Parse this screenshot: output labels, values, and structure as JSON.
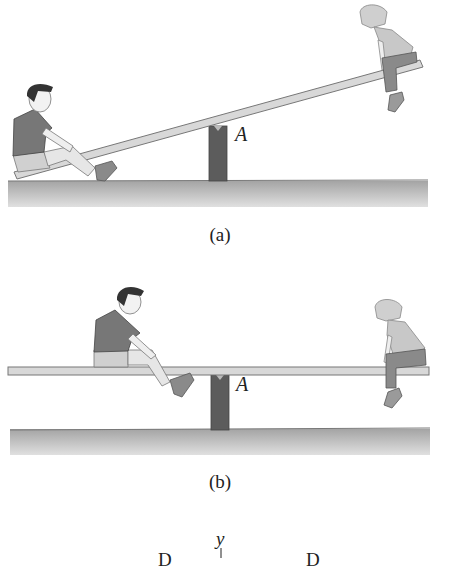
{
  "figure_a": {
    "caption": "(a)",
    "pivot_label": "A",
    "description": "Seesaw tilted: boy sitting on low left end touching ground, girl on raised right end"
  },
  "figure_b": {
    "caption": "(b)",
    "pivot_label": "A",
    "description": "Seesaw balanced horizontally: boy sitting nearer pivot on left, girl at far right end"
  },
  "figure_c": {
    "axis_label": "y",
    "left_label": "D",
    "right_label": "D"
  },
  "colors": {
    "post": "#5c5c5c",
    "ground_top": "#a8a8a8",
    "ground_bottom": "#dcdcdc",
    "plank": "#d8d8d8",
    "plank_stroke": "#7a7a7a",
    "boy_shirt": "#777777",
    "girl_shirt": "#c8c8c8",
    "girl_pants": "#8a8a8a"
  }
}
